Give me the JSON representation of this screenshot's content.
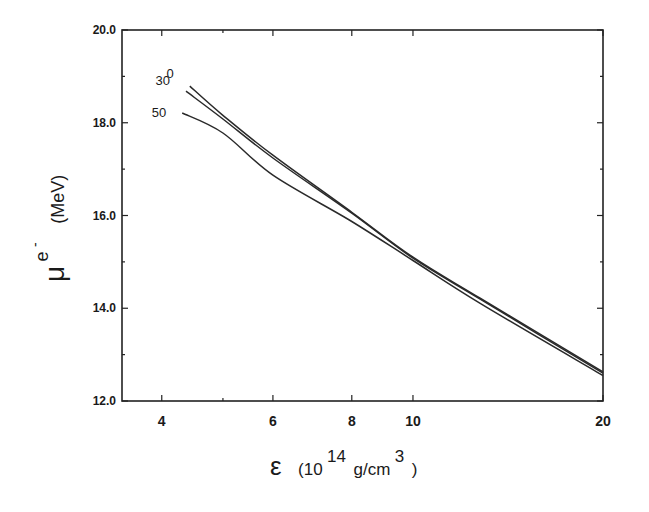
{
  "chart_data": {
    "type": "line",
    "title": "",
    "xlabel": "ε (10^14 g/cm^3)",
    "ylabel": "μ^e⁻ (MeV)",
    "xscale": "log",
    "xlim": [
      3.46,
      20
    ],
    "ylim": [
      12.0,
      20.0
    ],
    "grid": false,
    "legend_position": "inline labels at left of curves",
    "x_ticks": [
      4,
      6,
      8,
      10,
      20
    ],
    "x_tick_labels": [
      "4",
      "6",
      "8",
      "10",
      "20"
    ],
    "x_minor_ticks": [
      5
    ],
    "y_ticks": [
      12.0,
      14.0,
      16.0,
      18.0,
      20.0
    ],
    "y_tick_labels": [
      "12.0",
      "14.0",
      "16.0",
      "18.0",
      "20.0"
    ],
    "y_minor_ticks": [
      13.0,
      15.0,
      17.0,
      19.0
    ],
    "series": [
      {
        "name": "0",
        "x": [
          4.43,
          5,
          6,
          8,
          10,
          12.8,
          20
        ],
        "values": [
          18.79,
          18.16,
          17.3,
          16.07,
          15.1,
          14.21,
          12.63
        ]
      },
      {
        "name": "30",
        "x": [
          4.37,
          5,
          6,
          8,
          10,
          12.8,
          20
        ],
        "values": [
          18.68,
          18.08,
          17.24,
          16.05,
          15.08,
          14.19,
          12.6
        ]
      },
      {
        "name": "50",
        "x": [
          4.31,
          5,
          6,
          8,
          10,
          12.8,
          20
        ],
        "values": [
          18.21,
          17.78,
          16.87,
          15.87,
          15.03,
          14.1,
          12.55
        ]
      }
    ]
  },
  "labels": {
    "x_axis": {
      "symbol": "ε",
      "open": "(10",
      "exp": "14",
      "unit": "g/cm",
      "unit_exp": "3",
      "close": ")"
    },
    "y_axis": {
      "symbol": "μ",
      "sup": "e",
      "sup2": "-",
      "unit": "(MeV)"
    }
  }
}
